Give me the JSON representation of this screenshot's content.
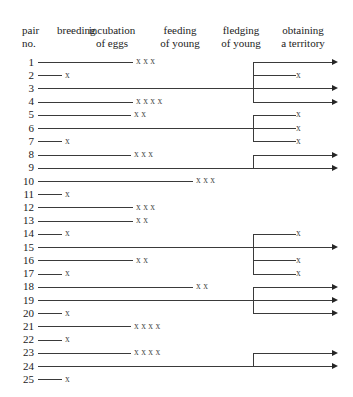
{
  "figure": {
    "title": "",
    "row_label_header": [
      "pair",
      "no."
    ],
    "columns": [
      {
        "id": "pair-no",
        "label_lines": [
          "pair",
          "no."
        ],
        "align": "left",
        "x": 22,
        "y": 24
      },
      {
        "id": "breeding",
        "label_lines": [
          "breeding",
          ""
        ],
        "align": "left",
        "x": 57,
        "y": 24
      },
      {
        "id": "incubation-of-eggs",
        "label_lines": [
          "incubation",
          "of eggs"
        ],
        "align": "center",
        "x": 112,
        "y": 24
      },
      {
        "id": "feeding-of-young",
        "label_lines": [
          "feeding",
          "of young"
        ],
        "align": "center",
        "x": 180,
        "y": 24
      },
      {
        "id": "fledging-of-young",
        "label_lines": [
          "fledging",
          "of young"
        ],
        "align": "center",
        "x": 241,
        "y": 24
      },
      {
        "id": "obtaining-a-territory",
        "label_lines": [
          "obtaining",
          "a territory"
        ],
        "align": "center",
        "x": 303,
        "y": 24
      }
    ]
  },
  "chart_data": {
    "type": "table",
    "xlabel": "",
    "ylabel": "pair no.",
    "categories": [
      "1",
      "2",
      "3",
      "4",
      "5",
      "6",
      "7",
      "8",
      "9",
      "10",
      "11",
      "12",
      "13",
      "14",
      "15",
      "16",
      "17",
      "18",
      "19",
      "20",
      "21",
      "22",
      "23",
      "24",
      "25"
    ],
    "stages": [
      "breeding",
      "incubation of eggs",
      "feeding of young",
      "fledging of young",
      "obtaining a territory"
    ],
    "legend": [],
    "grid": false,
    "rows": [
      {
        "no": "1",
        "line_end": 133,
        "marks": 3,
        "mark_x": 136,
        "bracket": "A"
      },
      {
        "no": "2",
        "line_end": 62,
        "marks": 1,
        "mark_x": 65,
        "bracket": "A"
      },
      {
        "no": "3",
        "line_end": 253,
        "marks": 0,
        "mark_x": 0,
        "bracket": "A"
      },
      {
        "no": "4",
        "line_end": 133,
        "marks": 4,
        "mark_x": 136,
        "bracket": "A"
      },
      {
        "no": "5",
        "line_end": 131,
        "marks": 2,
        "mark_x": 134,
        "bracket": "B"
      },
      {
        "no": "6",
        "line_end": 253,
        "marks": 0,
        "mark_x": 0,
        "bracket": "B"
      },
      {
        "no": "7",
        "line_end": 62,
        "marks": 1,
        "mark_x": 65,
        "bracket": "B"
      },
      {
        "no": "8",
        "line_end": 131,
        "marks": 3,
        "mark_x": 134,
        "bracket": "C"
      },
      {
        "no": "9",
        "line_end": 253,
        "marks": 0,
        "mark_x": 0,
        "bracket": "C"
      },
      {
        "no": "10",
        "line_end": 193,
        "marks": 3,
        "mark_x": 196,
        "bracket": ""
      },
      {
        "no": "11",
        "line_end": 62,
        "marks": 1,
        "mark_x": 65,
        "bracket": ""
      },
      {
        "no": "12",
        "line_end": 133,
        "marks": 3,
        "mark_x": 136,
        "bracket": ""
      },
      {
        "no": "13",
        "line_end": 133,
        "marks": 2,
        "mark_x": 136,
        "bracket": ""
      },
      {
        "no": "14",
        "line_end": 62,
        "marks": 1,
        "mark_x": 65,
        "bracket": "D"
      },
      {
        "no": "15",
        "line_end": 253,
        "marks": 0,
        "mark_x": 0,
        "bracket": "D"
      },
      {
        "no": "16",
        "line_end": 133,
        "marks": 2,
        "mark_x": 136,
        "bracket": "D"
      },
      {
        "no": "17",
        "line_end": 62,
        "marks": 1,
        "mark_x": 65,
        "bracket": "D"
      },
      {
        "no": "18",
        "line_end": 193,
        "marks": 2,
        "mark_x": 196,
        "bracket": "E"
      },
      {
        "no": "19",
        "line_end": 253,
        "marks": 0,
        "mark_x": 0,
        "bracket": "E"
      },
      {
        "no": "20",
        "line_end": 62,
        "marks": 1,
        "mark_x": 65,
        "bracket": "E"
      },
      {
        "no": "21",
        "line_end": 131,
        "marks": 4,
        "mark_x": 134,
        "bracket": ""
      },
      {
        "no": "22",
        "line_end": 62,
        "marks": 1,
        "mark_x": 65,
        "bracket": ""
      },
      {
        "no": "23",
        "line_end": 131,
        "marks": 4,
        "mark_x": 134,
        "bracket": "F"
      },
      {
        "no": "24",
        "line_end": 253,
        "marks": 0,
        "mark_x": 0,
        "bracket": "F"
      },
      {
        "no": "25",
        "line_end": 62,
        "marks": 1,
        "mark_x": 65,
        "bracket": ""
      }
    ],
    "brackets": [
      {
        "id": "A",
        "stem_row": "3",
        "rows": [
          "1",
          "2",
          "3",
          "4"
        ],
        "branches": [
          {
            "row": "1",
            "end": 338,
            "tip": "arrow"
          },
          {
            "row": "2",
            "end": 296,
            "tip": "x"
          },
          {
            "row": "3",
            "end": 338,
            "tip": "arrow"
          },
          {
            "row": "4",
            "end": 338,
            "tip": "arrow"
          }
        ]
      },
      {
        "id": "B",
        "stem_row": "6",
        "rows": [
          "5",
          "6",
          "7"
        ],
        "branches": [
          {
            "row": "5",
            "end": 296,
            "tip": "x"
          },
          {
            "row": "6",
            "end": 296,
            "tip": "x"
          },
          {
            "row": "7",
            "end": 296,
            "tip": "x"
          }
        ]
      },
      {
        "id": "C",
        "stem_row": "9",
        "rows": [
          "8",
          "9"
        ],
        "branches": [
          {
            "row": "8",
            "end": 338,
            "tip": "arrow"
          },
          {
            "row": "9",
            "end": 338,
            "tip": "arrow"
          }
        ]
      },
      {
        "id": "D",
        "stem_row": "15",
        "rows": [
          "14",
          "15",
          "16",
          "17"
        ],
        "branches": [
          {
            "row": "14",
            "end": 296,
            "tip": "x"
          },
          {
            "row": "15",
            "end": 338,
            "tip": "arrow"
          },
          {
            "row": "16",
            "end": 296,
            "tip": "x"
          },
          {
            "row": "17",
            "end": 296,
            "tip": "x"
          }
        ]
      },
      {
        "id": "E",
        "stem_row": "19",
        "rows": [
          "18",
          "19",
          "20"
        ],
        "branches": [
          {
            "row": "18",
            "end": 338,
            "tip": "arrow"
          },
          {
            "row": "19",
            "end": 338,
            "tip": "arrow"
          },
          {
            "row": "20",
            "end": 338,
            "tip": "arrow"
          }
        ]
      },
      {
        "id": "F",
        "stem_row": "24",
        "rows": [
          "23",
          "24"
        ],
        "branches": [
          {
            "row": "23",
            "end": 338,
            "tip": "arrow"
          },
          {
            "row": "24",
            "end": 338,
            "tip": "arrow"
          }
        ]
      }
    ],
    "geometry": {
      "row0_y": 62,
      "row_step": 13.22,
      "line_start_x": 38,
      "bracket_x": 253,
      "mark_glyph": "x",
      "mark_step": 12
    }
  }
}
